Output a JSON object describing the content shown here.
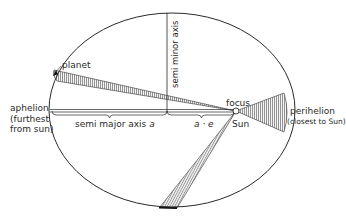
{
  "diagram": {
    "labels": {
      "planet": "planet",
      "aphelion": "aphelion",
      "aphelion_note_1": "(furthest",
      "aphelion_note_2": "from sun)",
      "perihelion": "perihelion",
      "perihelion_note": "(closest to Sun)",
      "focus": "focus",
      "sun": "Sun",
      "semi_major_axis": "semi major axis",
      "semi_major_symbol": "a",
      "a_times_e": "a · e",
      "semi_minor_axis": "semi minor axis"
    },
    "geometry": {
      "ellipse": {
        "cx": 172,
        "cy": 110,
        "rx": 123,
        "ry": 97
      },
      "focus": {
        "x": 236,
        "y": 111
      },
      "semi_minor_axis_x": 167,
      "major_axis_y": 111,
      "sectors": [
        {
          "name": "aphelion-sector",
          "p1": [
            54,
            70
          ],
          "p2": [
            57,
            81
          ]
        },
        {
          "name": "perihelion-sector",
          "p1": [
            284,
            93
          ],
          "p2": [
            284,
            132
          ]
        },
        {
          "name": "lower-sector",
          "p1": [
            160,
            207
          ],
          "p2": [
            177,
            208
          ]
        }
      ]
    },
    "colors": {
      "line": "#2a2a2a",
      "hatch": "#555555",
      "background": "#ffffff"
    }
  }
}
